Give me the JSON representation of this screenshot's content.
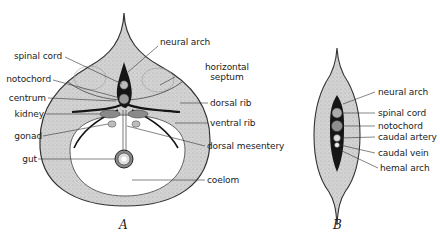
{
  "figure_a": {
    "caption": "A",
    "labels": {
      "spinal_cord": "spinal cord",
      "notochord": "notochord",
      "centrum": "centrum",
      "kidney": "kidney",
      "gonad": "gonad",
      "gut": "gut",
      "neural_arch": "neural arch",
      "horizontal_septum_1": "horizontal",
      "horizontal_septum_2": "septum",
      "dorsal_rib": "dorsal rib",
      "ventral_rib": "ventral rib",
      "dorsal_mesentery": "dorsal mesentery",
      "coelom": "coelom"
    }
  },
  "figure_b": {
    "caption": "B",
    "labels": {
      "neural_arch": "neural arch",
      "spinal_cord": "spinal cord",
      "notochord": "notochord",
      "caudal_artery": "caudal artery",
      "caudal_vein": "caudal vein",
      "hemal_arch": "hemal arch"
    }
  },
  "colors": {
    "tissue": "#cfcfcf",
    "outline": "#3a3a3a",
    "dark": "#151515",
    "coelom": "#ffffff"
  }
}
